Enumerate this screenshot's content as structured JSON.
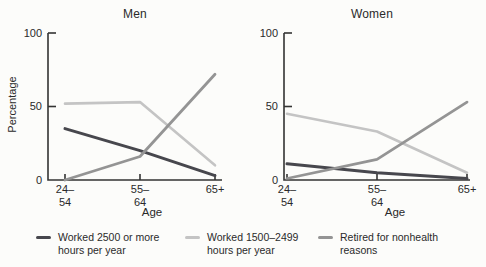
{
  "figure_background": "#fcfcfa",
  "colors": {
    "series": [
      "#47474d",
      "#c4c4c4",
      "#949494"
    ],
    "axis": "#333333",
    "text": "#2a2a2a"
  },
  "y_axis": {
    "label": "Percentage",
    "tick_labels": [
      "100",
      "50",
      "0"
    ],
    "ticks": [
      100,
      50,
      0
    ]
  },
  "x_axis": {
    "label": "Age",
    "tick_labels": [
      "24–\n54",
      "55–\n64",
      "65+"
    ]
  },
  "legend": {
    "items": [
      {
        "label": "Worked 2500 or more hours per year",
        "display": "Worked 2500 or more\nhours per year"
      },
      {
        "label": "Worked 1500–2499 hours per year",
        "display": "Worked 1500–2499\nhours per year"
      },
      {
        "label": "Retired for nonhealth reasons",
        "display": "Retired for nonhealth\nreasons"
      }
    ]
  },
  "chart_data": [
    {
      "type": "line",
      "title": "Men",
      "categories": [
        "24–54",
        "55–64",
        "65+"
      ],
      "series": [
        {
          "name": "Worked 2500 or more hours per year",
          "values": [
            35,
            20,
            3
          ]
        },
        {
          "name": "Worked 1500–2499 hours per year",
          "values": [
            52,
            53,
            10
          ]
        },
        {
          "name": "Retired for nonhealth reasons",
          "values": [
            0,
            16,
            72
          ]
        }
      ],
      "xlabel": "Age",
      "ylabel": "Percentage",
      "ylim": [
        0,
        100
      ],
      "yticks": [
        0,
        50,
        100
      ],
      "grid": false,
      "legend_position": "bottom"
    },
    {
      "type": "line",
      "title": "Women",
      "categories": [
        "24–54",
        "55–64",
        "65+"
      ],
      "series": [
        {
          "name": "Worked 2500 or more hours per year",
          "values": [
            11,
            5,
            1
          ]
        },
        {
          "name": "Worked 1500–2499 hours per year",
          "values": [
            45,
            33,
            5
          ]
        },
        {
          "name": "Retired for nonhealth reasons",
          "values": [
            1,
            14,
            53
          ]
        }
      ],
      "xlabel": "Age",
      "ylabel": "Percentage",
      "ylim": [
        0,
        100
      ],
      "yticks": [
        0,
        50,
        100
      ],
      "grid": false,
      "legend_position": "bottom"
    }
  ]
}
